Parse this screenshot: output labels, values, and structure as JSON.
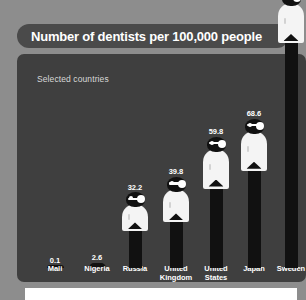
{
  "header": {
    "title": "Number of dentists per 100,000 people",
    "subtitle": "Selected countries"
  },
  "colors": {
    "page_background": "#8d8d8d",
    "panel_background": "#3f3f3f",
    "title_pill": "#4a4a4a",
    "figure_dark": "#111111",
    "figure_coat": "#f4f4f4",
    "text": "#ffffff",
    "bottom_panel": "#ffffff"
  },
  "chart_data": {
    "type": "bar",
    "title": "Number of dentists per 100,000 people",
    "subtitle": "Selected countries",
    "xlabel": "",
    "ylabel": "",
    "ylim": [
      0,
      132
    ],
    "grid": false,
    "legend": "none",
    "note": "Each bar is drawn as a stylized dentist pictogram; the Sweden value label is clipped by the top edge of the screenshot.",
    "categories": [
      "Mali",
      "Nigeria",
      "Russia",
      "United Kingdom",
      "United States",
      "Japan",
      "Sweden"
    ],
    "values": [
      0.1,
      2.6,
      32.2,
      39.8,
      59.8,
      68.6,
      132
    ],
    "value_labels": [
      "0.1",
      "2.6",
      "32.2",
      "39.8",
      "59.8",
      "68.6",
      "132"
    ]
  }
}
